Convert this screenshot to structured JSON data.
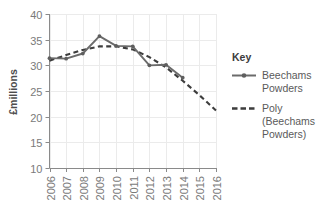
{
  "chart_data": {
    "type": "line",
    "title": "",
    "xlabel": "",
    "ylabel": "£millions",
    "categories": [
      "2006",
      "2007",
      "2008",
      "2009",
      "2010",
      "2011",
      "2012",
      "2013",
      "2014",
      "2015",
      "2016"
    ],
    "ylim": [
      10,
      40
    ],
    "ytick_labels": [
      "10",
      "15",
      "20",
      "25",
      "30",
      "35",
      "40"
    ],
    "yticks": [
      10,
      15,
      20,
      25,
      30,
      35,
      40
    ],
    "grid": true,
    "legend_position": "right",
    "series": [
      {
        "name": "Beechams Powders",
        "style": "solid",
        "marker": true,
        "color": "#6b6b6b",
        "x": [
          "2006",
          "2007",
          "2008",
          "2009",
          "2010",
          "2011",
          "2012",
          "2013",
          "2014"
        ],
        "values": [
          31.4,
          31.3,
          32.3,
          35.7,
          33.8,
          33.7,
          30.0,
          30.1,
          27.6
        ]
      },
      {
        "name": "Poly (Beechams Powders)",
        "style": "dashed",
        "marker": false,
        "color": "#3d3d3d",
        "x": [
          "2006",
          "2007",
          "2008",
          "2009",
          "2010",
          "2011",
          "2012",
          "2013",
          "2014",
          "2015",
          "2016"
        ],
        "values": [
          30.9,
          32.0,
          33.0,
          33.7,
          33.7,
          33.1,
          31.6,
          29.6,
          27.0,
          24.2,
          21.2
        ]
      }
    ]
  },
  "legend": {
    "title": "Key",
    "entries": [
      {
        "label_line1": "Beechams",
        "label_line2": "Powders",
        "label_line3": ""
      },
      {
        "label_line1": "Poly",
        "label_line2": "(Beechams",
        "label_line3": "Powders)"
      }
    ]
  },
  "colors": {
    "background": "#ffffff",
    "gridline": "#ebebeb",
    "axis": "#808080",
    "series_solid": "#6b6b6b",
    "series_dashed": "#3d3d3d",
    "tick_text": "#7a7a7a",
    "legend_text": "#5a5a5a"
  }
}
